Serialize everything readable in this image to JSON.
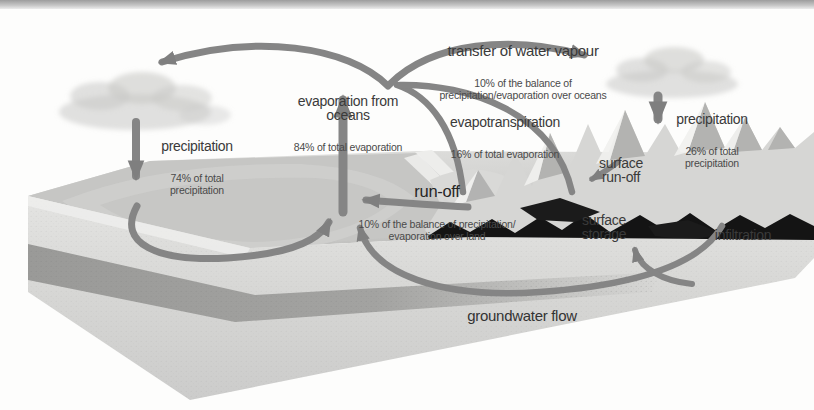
{
  "diagram_title": "hydrological cycle diagram",
  "labels": {
    "transfer": {
      "main": "transfer of water vapour",
      "sub": "10% of the balance of\nprecipitation/evaporation over oceans"
    },
    "evaporation_oceans": {
      "main": "evaporation from\noceans",
      "sub": "84% of total evaporation"
    },
    "evapotranspiration": {
      "main": "evapotranspiration",
      "sub": "16% of total evaporation"
    },
    "precipitation_right": {
      "main": "precipitation",
      "sub": "26% of total\nprecipitation"
    },
    "precipitation_left": {
      "main": "precipitation",
      "sub": "74% of total\nprecipitation"
    },
    "runoff": {
      "main": "run-off",
      "sub": "10% of the balance of precipitation/\nevaporation over land"
    },
    "surface_runoff": {
      "main": "surface\nrun-off"
    },
    "surface_storage": {
      "main": "surface\nstorage"
    },
    "infiltration": {
      "main": "infiltration"
    },
    "groundwater": {
      "main": "groundwater flow"
    }
  },
  "icons": [
    "evaporation-arrow",
    "transfer-arc-left-arrow",
    "transfer-arc-right-arrow",
    "evapotranspiration-arrow-1",
    "evapotranspiration-arrow-2",
    "precipitation-left-arrow",
    "precipitation-right-arrow",
    "runoff-arrow",
    "ocean-circulation-arrow",
    "surface-runoff-arrow",
    "groundwater-flow-arrow",
    "capillary-rise-arrow",
    "cloud-left",
    "cloud-right"
  ],
  "colors": {
    "arrow_gray": "#858585",
    "label_dark": "#3a3a3a",
    "sublabel_gray": "#4a4a4a",
    "cloud_gray": "#c9c9c7",
    "terrain_light": "#d7d7d5",
    "ocean_gray": "#c6c6c4",
    "mountain_shadow": "#141414",
    "top_bar": "#a8a8a8"
  }
}
